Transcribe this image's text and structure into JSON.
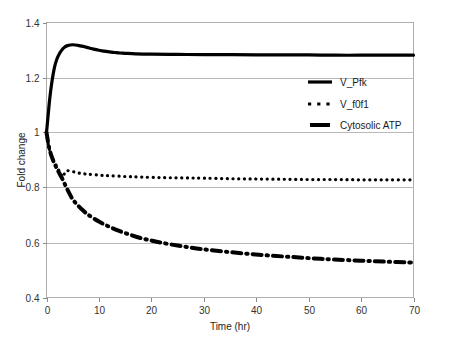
{
  "chart_data": {
    "type": "line",
    "title": "",
    "xlabel": "Time (hr)",
    "ylabel": "Fold change",
    "xlim": [
      0,
      70
    ],
    "ylim": [
      0.4,
      1.4
    ],
    "xticks": [
      "0",
      "10",
      "20",
      "30",
      "40",
      "50",
      "60",
      "70"
    ],
    "yticks": [
      "0.4",
      "0.6",
      "0.8",
      "1",
      "1.2",
      "1.4"
    ],
    "grid": "horizontal",
    "legend_position": "inside-upper-right",
    "series": [
      {
        "name": "V_Pfk",
        "style": "solid",
        "color": "#000000",
        "x": [
          0,
          0.3,
          0.6,
          1,
          1.5,
          2,
          2.5,
          3,
          3.5,
          4,
          5,
          6,
          7,
          8,
          9,
          10,
          11,
          12,
          13,
          14,
          15,
          17,
          20,
          25,
          30,
          35,
          40,
          45,
          50,
          55,
          60,
          65,
          70
        ],
        "values": [
          1.0,
          1.06,
          1.12,
          1.18,
          1.235,
          1.268,
          1.288,
          1.302,
          1.311,
          1.316,
          1.319,
          1.317,
          1.313,
          1.308,
          1.303,
          1.299,
          1.296,
          1.293,
          1.291,
          1.289,
          1.288,
          1.286,
          1.285,
          1.284,
          1.283,
          1.283,
          1.282,
          1.282,
          1.282,
          1.281,
          1.281,
          1.281,
          1.281
        ]
      },
      {
        "name": "V_f0f1",
        "style": "dotted",
        "color": "#000000",
        "x": [
          0,
          0.3,
          0.6,
          1,
          1.4,
          1.8,
          2.2,
          2.6,
          3.0,
          3.3,
          3.6,
          4,
          5,
          6,
          7,
          8,
          10,
          12,
          15,
          18,
          22,
          26,
          30,
          35,
          40,
          45,
          50,
          55,
          60,
          65,
          70
        ],
        "values": [
          1.0,
          0.962,
          0.935,
          0.912,
          0.896,
          0.882,
          0.868,
          0.852,
          0.838,
          0.846,
          0.857,
          0.861,
          0.858,
          0.853,
          0.85,
          0.848,
          0.845,
          0.843,
          0.84,
          0.838,
          0.836,
          0.835,
          0.834,
          0.832,
          0.831,
          0.83,
          0.829,
          0.829,
          0.828,
          0.828,
          0.828
        ]
      },
      {
        "name": "Cytosolic ATP",
        "style": "dash-dot",
        "color": "#000000",
        "x": [
          0,
          0.5,
          1,
          1.5,
          2,
          2.5,
          3,
          3.5,
          4,
          5,
          6,
          7,
          8,
          10,
          12,
          14,
          16,
          18,
          20,
          22,
          25,
          28,
          31,
          35,
          39,
          43,
          47,
          51,
          55,
          60,
          65,
          70
        ],
        "values": [
          1.0,
          0.945,
          0.912,
          0.888,
          0.868,
          0.85,
          0.832,
          0.812,
          0.792,
          0.757,
          0.735,
          0.716,
          0.7,
          0.676,
          0.657,
          0.641,
          0.628,
          0.616,
          0.607,
          0.599,
          0.589,
          0.58,
          0.573,
          0.565,
          0.558,
          0.552,
          0.547,
          0.542,
          0.538,
          0.534,
          0.53,
          0.527
        ]
      }
    ]
  },
  "legend": {
    "items": [
      {
        "label": "V_Pfk",
        "marker": "solid-line-swatch"
      },
      {
        "label": "V_f0f1",
        "marker": "dotted-line-swatch"
      },
      {
        "label": "Cytosolic ATP",
        "marker": "dashed-line-swatch"
      }
    ]
  }
}
